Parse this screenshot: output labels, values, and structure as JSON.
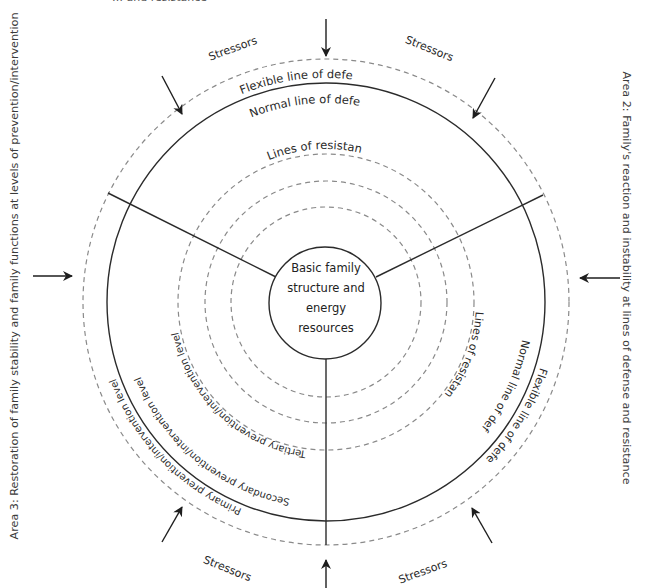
{
  "top_partial_caption": "… and resistance",
  "left_caption": "Area 3: Restoration of family stability and family functions at levels of prevention/intervention",
  "right_caption": "Area 2: Family's reaction and instability at lines of defense and resistance",
  "core": {
    "lines": [
      "Basic family",
      "structure and",
      "energy",
      "resources"
    ]
  },
  "rings": {
    "flexible_line": "Flexible line of defense",
    "normal_line": "Normal line of defense",
    "lines_of_resistance": "Lines of resistance",
    "resistance_ring_count": 3
  },
  "right_sector_labels": {
    "lines_of_resistance": "Lines of resistance",
    "normal_line": "Normal line of defense",
    "flexible_line": "Flexible line of defense"
  },
  "prevention_levels": {
    "tertiary": "Tertiary prevention/intervention level",
    "secondary": "Secondary prevention/intervention level",
    "primary": "Primary prevention/intervention level"
  },
  "stressors": {
    "top_left": "Stressors",
    "top_right": "Stressors",
    "bottom_left": "Stressors",
    "bottom_right": "Stressors"
  },
  "arrows": [
    "top",
    "top-left",
    "top-right",
    "left",
    "right",
    "bottom-left",
    "bottom-right",
    "bottom"
  ],
  "colors": {
    "solid_line": "#2b2b2b",
    "dashed_line": "#8a8a8a",
    "text": "#2a2a2a"
  }
}
